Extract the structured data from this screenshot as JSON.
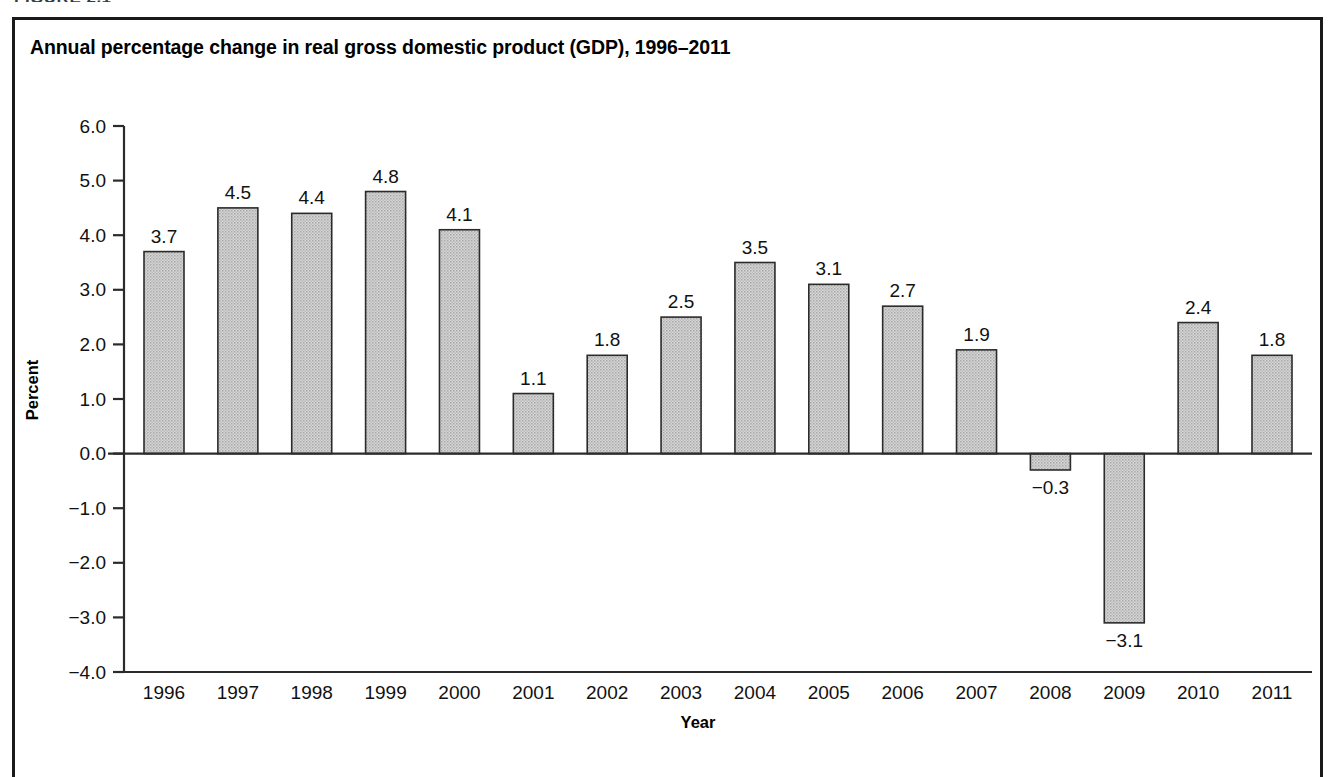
{
  "figure": {
    "number_label": "FIGURE 2.1",
    "title": "Annual percentage change in real gross domestic product (GDP), 1996–2011"
  },
  "chart_data": {
    "type": "bar",
    "title": "Annual percentage change in real gross domestic product (GDP), 1996–2011",
    "xlabel": "Year",
    "ylabel": "Percent",
    "categories": [
      "1996",
      "1997",
      "1998",
      "1999",
      "2000",
      "2001",
      "2002",
      "2003",
      "2004",
      "2005",
      "2006",
      "2007",
      "2008",
      "2009",
      "2010",
      "2011"
    ],
    "values": [
      3.7,
      4.5,
      4.4,
      4.8,
      4.1,
      1.1,
      1.8,
      2.5,
      3.5,
      3.1,
      2.7,
      1.9,
      -0.3,
      -3.1,
      2.4,
      1.8
    ],
    "value_labels": [
      "3.7",
      "4.5",
      "4.4",
      "4.8",
      "4.1",
      "1.1",
      "1.8",
      "2.5",
      "3.5",
      "3.1",
      "2.7",
      "1.9",
      "−0.3",
      "−3.1",
      "2.4",
      "1.8"
    ],
    "ylim": [
      -4.0,
      6.0
    ],
    "ytick_values": [
      6.0,
      5.0,
      4.0,
      3.0,
      2.0,
      1.0,
      0.0,
      -1.0,
      -2.0,
      -3.0,
      -4.0
    ],
    "ytick_labels": [
      "6.0",
      "5.0",
      "4.0",
      "3.0",
      "2.0",
      "1.0",
      "0.0",
      "−1.0",
      "−2.0",
      "−3.0",
      "−4.0"
    ],
    "grid": false,
    "legend": "none",
    "bar_fill_color": "#c9c9c9",
    "bar_border_color": "#2b2b2b",
    "axis_color": "#2b2b2b",
    "frame_color": "#1a1a1a",
    "background_color": "#ffffff"
  }
}
